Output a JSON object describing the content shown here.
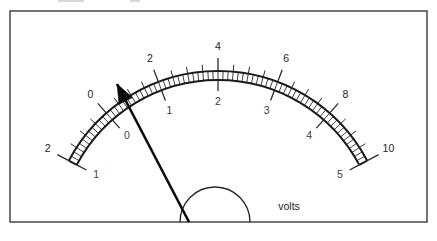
{
  "meter": {
    "unit_label": "volts",
    "frame": {
      "x": 10,
      "y": 11,
      "width": 417,
      "height": 211,
      "border_color": "#3a3a3a"
    },
    "pivot": {
      "x": 189,
      "y": 222
    },
    "hub": {
      "center_x": 215,
      "radius": 35
    },
    "arc": {
      "center_x": 218,
      "center_y": 240,
      "radius_inner": 160,
      "radius_outer": 169,
      "start_angle_deg": 208,
      "end_angle_deg": 332
    },
    "needle": {
      "points_to_outer_value": 0,
      "points_to_inner_value": 0,
      "tip_x": 117,
      "tip_y": 84,
      "color": "#0b0b0b"
    },
    "outer_scale": {
      "name": "outer-scale",
      "min": -2,
      "max": 10,
      "major_step": 2,
      "minor_divisions_per_major": 4,
      "labels": [
        {
          "value": -2,
          "text": "2"
        },
        {
          "value": 0,
          "text": "0"
        },
        {
          "value": 2,
          "text": "2"
        },
        {
          "value": 4,
          "text": "4"
        },
        {
          "value": 6,
          "text": "6"
        },
        {
          "value": 8,
          "text": "8"
        },
        {
          "value": 10,
          "text": "10"
        }
      ]
    },
    "inner_scale": {
      "name": "inner-scale",
      "min": -1,
      "max": 5,
      "major_step": 1,
      "minor_divisions_per_major": 2,
      "labels": [
        {
          "value": -1,
          "text": "1"
        },
        {
          "value": 0,
          "text": "0"
        },
        {
          "value": 1,
          "text": "1"
        },
        {
          "value": 2,
          "text": "2"
        },
        {
          "value": 3,
          "text": "3"
        },
        {
          "value": 4,
          "text": "4"
        },
        {
          "value": 5,
          "text": "5"
        }
      ]
    },
    "colors": {
      "band_stroke": "#1a1a1a",
      "tick": "#2b2b2b",
      "text": "#242424",
      "needle": "#0b0b0b",
      "background": "#ffffff"
    }
  }
}
